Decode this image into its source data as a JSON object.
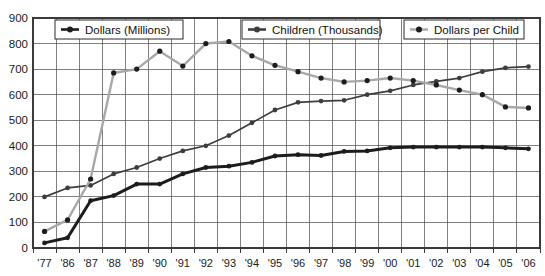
{
  "chart_data": {
    "type": "line",
    "title": "",
    "xlabel": "",
    "ylabel": "",
    "ylim": [
      0,
      900
    ],
    "ytick_step": 100,
    "grid": true,
    "legend_position": "top-inside",
    "categories": [
      "'77",
      "'86",
      "'87",
      "'88",
      "'89",
      "'90",
      "'91",
      "'92",
      "'93",
      "'94",
      "'95",
      "'96",
      "'97",
      "'98",
      "'99",
      "'00",
      "'01",
      "'02",
      "'03",
      "'04",
      "'05",
      "'06"
    ],
    "x": [
      "'77",
      "'86",
      "'87",
      "'88",
      "'89",
      "'90",
      "'91",
      "'92",
      "'93",
      "'94",
      "'95",
      "'96",
      "'97",
      "'98",
      "'99",
      "'00",
      "'01",
      "'02",
      "'03",
      "'04",
      "'05",
      "'06"
    ],
    "ytick_labels": [
      "900",
      "800",
      "700",
      "600",
      "500",
      "400",
      "300",
      "200",
      "100",
      "0"
    ],
    "ytick_values": [
      900,
      800,
      700,
      600,
      500,
      400,
      300,
      200,
      100,
      0
    ],
    "series": [
      {
        "name": "Dollars (Millions)",
        "color": "#1c1c1c",
        "width": 3.0,
        "values": [
          20,
          40,
          185,
          205,
          250,
          250,
          290,
          315,
          320,
          335,
          360,
          365,
          362,
          378,
          380,
          392,
          395,
          395,
          395,
          395,
          392,
          388
        ]
      },
      {
        "name": "Children (Thousands)",
        "color": "#3d3d3d",
        "width": 1.7,
        "values": [
          200,
          235,
          245,
          290,
          315,
          350,
          380,
          400,
          440,
          490,
          540,
          570,
          575,
          578,
          600,
          615,
          638,
          652,
          665,
          690,
          705,
          710
        ]
      },
      {
        "name": "Dollars per Child",
        "color": "#a8a8a8",
        "width": 2.4,
        "values": [
          65,
          110,
          270,
          685,
          700,
          770,
          712,
          800,
          808,
          752,
          715,
          690,
          665,
          650,
          655,
          665,
          655,
          638,
          618,
          600,
          552,
          548
        ]
      }
    ],
    "legend": [
      {
        "label": "Dollars (Millions)",
        "color": "#1c1c1c",
        "marker": "circle"
      },
      {
        "label": "Children (Thousands)",
        "color": "#3d3d3d",
        "marker": "circle"
      },
      {
        "label": "Dollars per Child",
        "color": "#a8a8a8",
        "marker": "circle"
      }
    ]
  }
}
